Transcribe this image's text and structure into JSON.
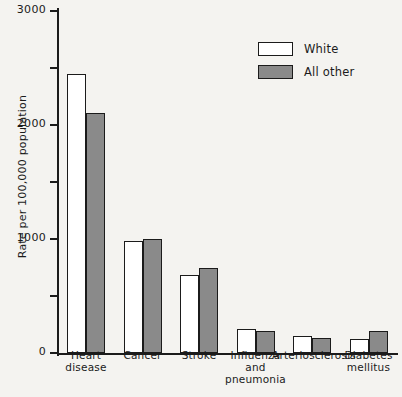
{
  "chart_data": {
    "type": "bar",
    "title": "",
    "xlabel": "",
    "ylabel": "Rate per 100,000 population",
    "ylim": [
      0,
      3000
    ],
    "ytick_labels": [
      "3000",
      "2000",
      "1000",
      "0"
    ],
    "yticks_major": [
      0,
      1000,
      2000,
      3000
    ],
    "yticks_minor": [
      500,
      1500,
      2500
    ],
    "grid": false,
    "legend_position": "top-right",
    "categories": [
      "Heart\ndisease",
      "Cancer",
      "Stroke",
      "Influenza\nand\npneumonia",
      "Arteriosclerosis",
      "Diabetes\nmellitus"
    ],
    "series": [
      {
        "name": "White",
        "color": "#ffffff",
        "values": [
          2450,
          980,
          685,
          215,
          145,
          120
        ]
      },
      {
        "name": "All other",
        "color": "#8a8a8a",
        "values": [
          2105,
          1000,
          745,
          190,
          130,
          190
        ]
      }
    ]
  },
  "legend": {
    "items": [
      {
        "label": "White"
      },
      {
        "label": "All other"
      }
    ]
  },
  "colors": {
    "white_series": "#ffffff",
    "other_series": "#8a8a8a",
    "ink": "#1b1b1b",
    "background": "#f4f3f0"
  }
}
